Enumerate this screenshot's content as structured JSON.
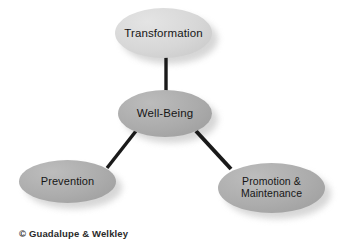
{
  "diagram": {
    "background_color": "#ffffff",
    "edge_color": "#1a1a1a",
    "nodes": [
      {
        "id": "transformation",
        "label": "Transformation",
        "fill_color": "#d7d7d7",
        "text_color": "#161616"
      },
      {
        "id": "wellbeing",
        "label": "Well-Being",
        "fill_color": "#ababab",
        "text_color": "#161616"
      },
      {
        "id": "prevention",
        "label": "Prevention",
        "fill_color": "#acacac",
        "text_color": "#161616"
      },
      {
        "id": "promotion",
        "label": "Promotion &\nMaintenance",
        "fill_color": "#acacac",
        "text_color": "#161616"
      }
    ],
    "edges": [
      {
        "id": "transformation-wellbeing",
        "from": "Transformation",
        "to": "Well-Being"
      },
      {
        "id": "wellbeing-prevention",
        "from": "Well-Being",
        "to": "Prevention"
      },
      {
        "id": "wellbeing-promotion",
        "from": "Well-Being",
        "to": "Promotion & Maintenance"
      }
    ]
  },
  "caption": {
    "copyright": "© Guadalupe & Welkley"
  }
}
